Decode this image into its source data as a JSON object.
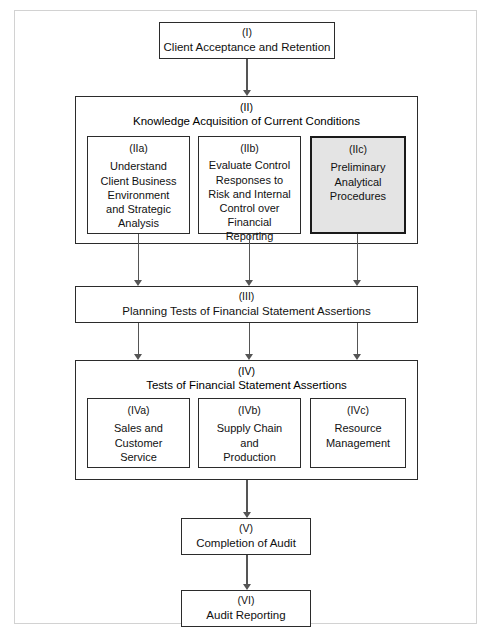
{
  "figure": {
    "type": "flowchart",
    "orientation": "top-to-bottom",
    "accent_shaded_fill": "#e4e4e4",
    "line_color": "#555555",
    "border_color": "#2b2b2b"
  },
  "stages": {
    "i": {
      "roman": "(I)",
      "title": "Client Acceptance and Retention"
    },
    "ii": {
      "roman": "(II)",
      "title": "Knowledge Acquisition of Current Conditions",
      "sub": [
        {
          "roman": "(IIa)",
          "title": "Understand\nClient Business\nEnvironment\nand Strategic\nAnalysis",
          "shaded": false
        },
        {
          "roman": "(IIb)",
          "title": "Evaluate Control\nResponses to\nRisk and Internal\nControl over\nFinancial\nReporting",
          "shaded": false
        },
        {
          "roman": "(IIc)",
          "title": "Preliminary\nAnalytical\nProcedures",
          "shaded": true
        }
      ]
    },
    "iii": {
      "roman": "(III)",
      "title": "Planning Tests of Financial Statement Assertions"
    },
    "iv": {
      "roman": "(IV)",
      "title": "Tests of Financial Statement Assertions",
      "sub": [
        {
          "roman": "(IVa)",
          "title": "Sales and\nCustomer\nService"
        },
        {
          "roman": "(IVb)",
          "title": "Supply Chain\nand\nProduction"
        },
        {
          "roman": "(IVc)",
          "title": "Resource\nManagement"
        }
      ]
    },
    "v": {
      "roman": "(V)",
      "title": "Completion of Audit"
    },
    "vi": {
      "roman": "(VI)",
      "title": "Audit Reporting"
    }
  }
}
